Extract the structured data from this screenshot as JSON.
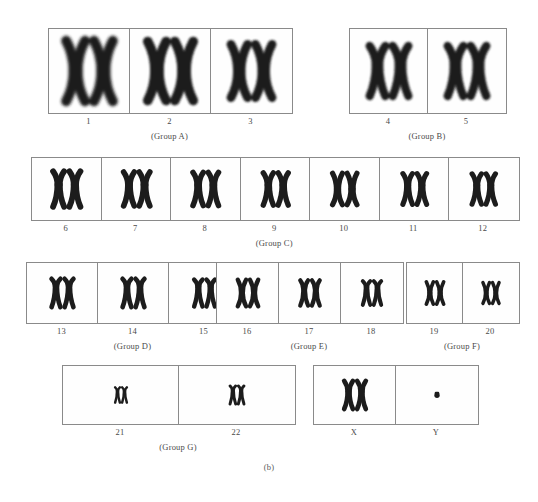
{
  "figure": {
    "caption": "(b)",
    "kind": "human-karyotype",
    "ink_color": "#1c1c1c",
    "border_color": "#8a8a8a",
    "background_color": "#ffffff"
  },
  "rows": [
    {
      "name": "row-1",
      "groups": [
        {
          "id": "group-a",
          "caption": "(Group A)",
          "left": 48,
          "top": 28,
          "cell_w": 81,
          "cell_h": 84,
          "cells": [
            {
              "label": "1",
              "shape": "metacentric",
              "size": 1.0,
              "count": 2
            },
            {
              "label": "2",
              "shape": "metacentric",
              "size": 0.97,
              "count": 2
            },
            {
              "label": "3",
              "shape": "metacentric",
              "size": 0.86,
              "count": 2
            }
          ]
        },
        {
          "id": "group-b",
          "caption": "(Group B)",
          "left": 349,
          "top": 28,
          "cell_w": 78,
          "cell_h": 84,
          "cells": [
            {
              "label": "4",
              "shape": "submetacentric",
              "size": 0.8,
              "count": 2
            },
            {
              "label": "5",
              "shape": "submetacentric",
              "size": 0.8,
              "count": 2
            }
          ]
        }
      ]
    },
    {
      "name": "row-2",
      "groups": [
        {
          "id": "group-c",
          "caption": "(Group C)",
          "left": 31,
          "top": 157,
          "cell_w": 69.5,
          "cell_h": 62,
          "cells": [
            {
              "label": "6",
              "shape": "submetacentric",
              "size": 0.76,
              "count": 2
            },
            {
              "label": "7",
              "shape": "submetacentric",
              "size": 0.72,
              "count": 2
            },
            {
              "label": "8",
              "shape": "submetacentric",
              "size": 0.7,
              "count": 2
            },
            {
              "label": "9",
              "shape": "submetacentric",
              "size": 0.68,
              "count": 2
            },
            {
              "label": "10",
              "shape": "metacentric",
              "size": 0.66,
              "count": 2
            },
            {
              "label": "11",
              "shape": "submetacentric",
              "size": 0.64,
              "count": 2
            },
            {
              "label": "12",
              "shape": "submetacentric",
              "size": 0.63,
              "count": 2
            }
          ]
        }
      ]
    },
    {
      "name": "row-3",
      "groups": [
        {
          "id": "group-d",
          "caption": "(Group D)",
          "left": 26,
          "top": 262,
          "cell_w": 71,
          "cell_h": 60,
          "cells": [
            {
              "label": "13",
              "shape": "acrocentric",
              "size": 0.6,
              "count": 2
            },
            {
              "label": "14",
              "shape": "acrocentric",
              "size": 0.6,
              "count": 2
            },
            {
              "label": "15",
              "shape": "acrocentric",
              "size": 0.56,
              "count": 2
            }
          ]
        },
        {
          "id": "group-e",
          "caption": "(Group E)",
          "left": 216,
          "top": 262,
          "cell_w": 62,
          "cell_h": 60,
          "cells": [
            {
              "label": "16",
              "shape": "metacentric",
              "size": 0.55,
              "count": 2
            },
            {
              "label": "17",
              "shape": "submetacentric",
              "size": 0.52,
              "count": 2
            },
            {
              "label": "18",
              "shape": "acrocentric",
              "size": 0.48,
              "count": 2
            }
          ]
        },
        {
          "id": "group-f",
          "caption": "(Group F)",
          "left": 406,
          "top": 262,
          "cell_w": 56,
          "cell_h": 60,
          "cells": [
            {
              "label": "19",
              "shape": "metacentric",
              "size": 0.44,
              "count": 2
            },
            {
              "label": "20",
              "shape": "metacentric",
              "size": 0.4,
              "count": 2
            }
          ]
        }
      ]
    },
    {
      "name": "row-4",
      "groups": [
        {
          "id": "group-g",
          "caption": "(Group G)",
          "left": 62,
          "top": 365,
          "cell_w": 116,
          "cell_h": 58,
          "cells": [
            {
              "label": "21",
              "shape": "acrocentric-tiny",
              "size": 0.26,
              "count": 2
            },
            {
              "label": "22",
              "shape": "acrocentric-tiny",
              "size": 0.34,
              "count": 2
            }
          ]
        },
        {
          "id": "group-sex",
          "caption": "",
          "left": 313,
          "top": 365,
          "cell_w": 82,
          "cell_h": 58,
          "cells": [
            {
              "label": "X",
              "shape": "submetacentric",
              "size": 0.62,
              "count": 2
            },
            {
              "label": "Y",
              "shape": "dot",
              "size": 0.16,
              "count": 1
            }
          ]
        }
      ]
    }
  ]
}
